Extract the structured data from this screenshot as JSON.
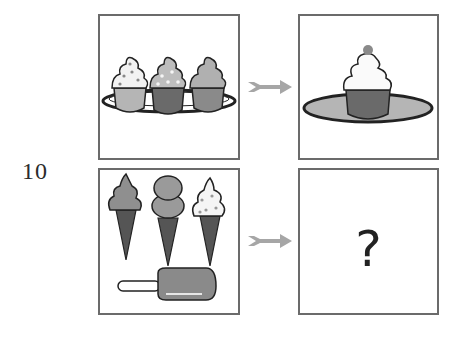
{
  "question": {
    "number": "10",
    "answer_placeholder": "?"
  },
  "panels": {
    "top_left": {
      "description": "three cupcakes on a plate",
      "items": [
        "cupcake-sprinkles-light",
        "cupcake-sprinkles-dark",
        "cupcake-plain"
      ]
    },
    "top_right": {
      "description": "single cupcake with cherry on a plate"
    },
    "bottom_left": {
      "description": "three ice cream cones and a popsicle",
      "items": [
        "soft-serve-cone",
        "double-scoop-cone",
        "sprinkle-cone",
        "popsicle"
      ]
    },
    "bottom_right": {
      "description": "unknown answer"
    }
  },
  "arrows": [
    "arrow-top",
    "arrow-bottom"
  ],
  "colors": {
    "border": "#6b6b6b",
    "arrow": "#a6a6a6",
    "light_gray": "#c8c8c8",
    "mid_gray": "#9a9a9a",
    "dark_gray": "#666666",
    "outline": "#222222"
  }
}
